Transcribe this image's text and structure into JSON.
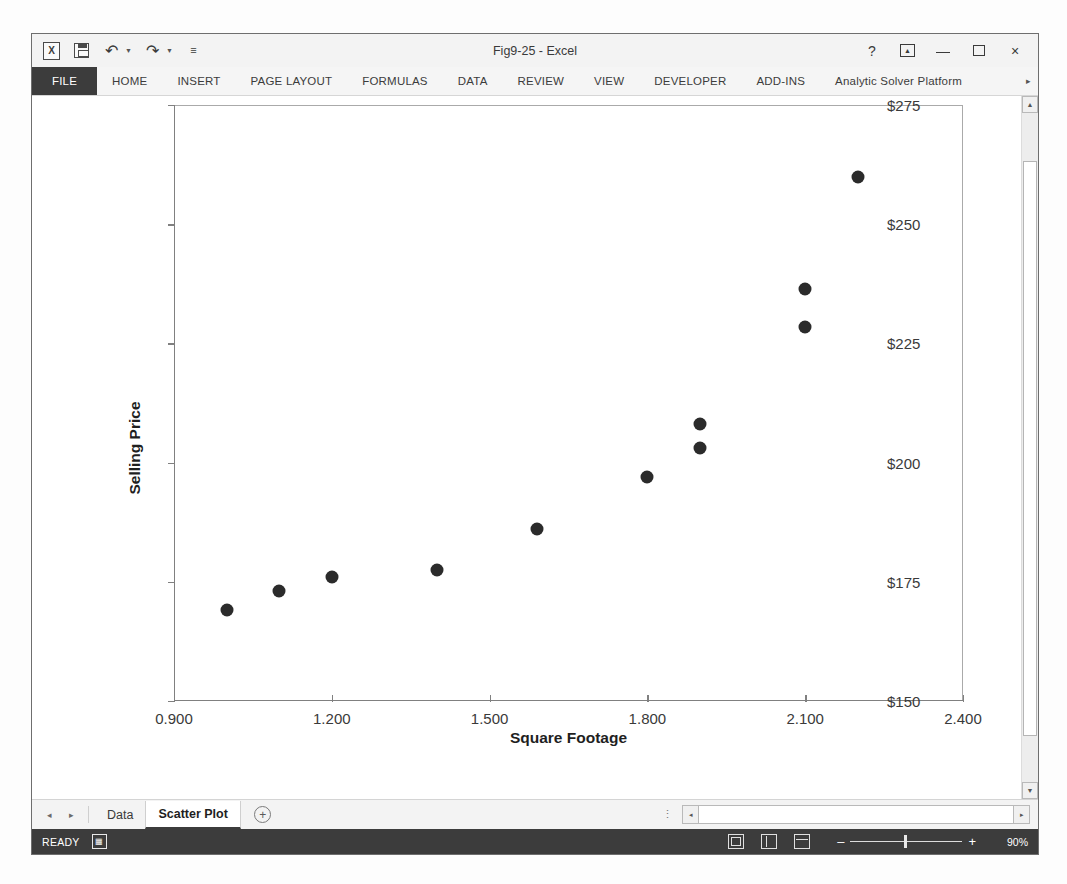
{
  "window": {
    "title": "Fig9-25 - Excel",
    "quick_access": [
      "excel-logo",
      "save-icon",
      "undo-icon",
      "redo-icon",
      "customize-qat-icon"
    ],
    "controls": {
      "help": "?",
      "ribbon_display": "ribbon-display-options",
      "minimize": "minimize",
      "maximize": "maximize",
      "close": "×"
    }
  },
  "ribbon": {
    "tabs": [
      "FILE",
      "HOME",
      "INSERT",
      "PAGE LAYOUT",
      "FORMULAS",
      "DATA",
      "REVIEW",
      "VIEW",
      "DEVELOPER",
      "ADD-INS",
      "Analytic Solver Platform"
    ],
    "active_tab": "FILE",
    "overflow": "▸"
  },
  "sheet_tabs": {
    "prev": "◂",
    "next": "▸",
    "tabs": [
      {
        "label": "Data",
        "active": false
      },
      {
        "label": "Scatter Plot",
        "active": true
      }
    ],
    "new_sheet": "+",
    "more": "⋮"
  },
  "status_bar": {
    "state": "READY",
    "macro_record_icon": "record-macro-icon",
    "views": [
      "normal-view-icon",
      "page-layout-view-icon",
      "page-break-preview-icon"
    ],
    "zoom_out": "–",
    "zoom_in": "+",
    "zoom_level": "90%"
  },
  "scrollbars": {
    "vertical_up": "▲",
    "vertical_down": "▼",
    "horizontal_left": "◂",
    "horizontal_right": "▸"
  },
  "chart_data": {
    "type": "scatter",
    "title": "",
    "xlabel": "Square Footage",
    "ylabel": "Selling Price",
    "xlim": [
      0.9,
      2.4
    ],
    "ylim": [
      150,
      275
    ],
    "xticks": [
      0.9,
      1.2,
      1.5,
      1.8,
      2.1,
      2.4
    ],
    "xticklabels": [
      "0.900",
      "1.200",
      "1.500",
      "1.800",
      "2.100",
      "2.400"
    ],
    "yticks": [
      150,
      175,
      200,
      225,
      250,
      275
    ],
    "yticklabels": [
      "$150",
      "$175",
      "$200",
      "$225",
      "$250",
      "$275"
    ],
    "grid": false,
    "legend": false,
    "marker": {
      "shape": "circle",
      "color": "#2b2b2b",
      "size": 13
    },
    "points": [
      {
        "x": 1.0,
        "y": 169.0
      },
      {
        "x": 1.1,
        "y": 173.0
      },
      {
        "x": 1.2,
        "y": 176.0
      },
      {
        "x": 1.4,
        "y": 177.5
      },
      {
        "x": 1.59,
        "y": 186.0
      },
      {
        "x": 1.8,
        "y": 197.0
      },
      {
        "x": 1.9,
        "y": 208.0
      },
      {
        "x": 1.9,
        "y": 203.0
      },
      {
        "x": 2.1,
        "y": 236.5
      },
      {
        "x": 2.1,
        "y": 228.5
      },
      {
        "x": 2.2,
        "y": 260.0
      }
    ]
  }
}
